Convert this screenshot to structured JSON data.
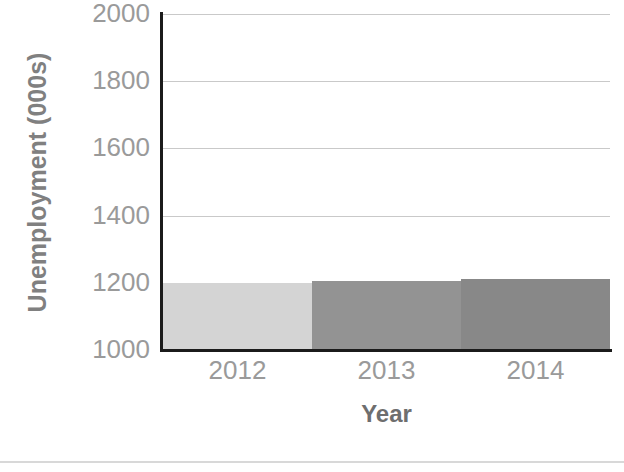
{
  "chart_data": {
    "type": "bar",
    "title": "",
    "subtitle": "",
    "xlabel": "Year",
    "ylabel": "Unemployment (000s)",
    "categories": [
      "2012",
      "2013",
      "2014"
    ],
    "values": [
      1200,
      1205,
      1212
    ],
    "series": [
      {
        "name": "Unemployment",
        "values": [
          1200,
          1205,
          1212
        ],
        "colors": [
          "#d4d4d4",
          "#939393",
          "#888888"
        ]
      }
    ],
    "ylim": [
      1000,
      2000
    ],
    "xlim_note": "categorical, three adjacent full-width bars",
    "yticks": [
      2000,
      1800,
      1600,
      1400,
      1200,
      1000
    ],
    "ytick_labels": [
      "2000",
      "1800",
      "1600",
      "1400",
      "1200",
      "1000"
    ],
    "xtick_labels": [
      "2012",
      "2013",
      "2014"
    ],
    "grid": "horizontal gridlines only",
    "legend": "none",
    "legend_position": "none",
    "annotations": []
  },
  "axes": {
    "y_title": "Unemployment (000s)",
    "x_title": "Year",
    "y_tick_labels": [
      "2000",
      "1800",
      "1600",
      "1400",
      "1200",
      "1000"
    ],
    "x_tick_labels": [
      "2012",
      "2013",
      "2014"
    ]
  },
  "style": {
    "background": "#ffffff",
    "axis_line_color": "#1b1b1b",
    "gridline_color": "#c9c9c9",
    "tick_text_color": "#9a9a9a",
    "axis_title_color": "#808080",
    "bar_color_1": "#d4d4d4",
    "bar_color_2": "#939393",
    "bar_color_3": "#888888",
    "bottom_rule_color": "#d8d8d8"
  }
}
